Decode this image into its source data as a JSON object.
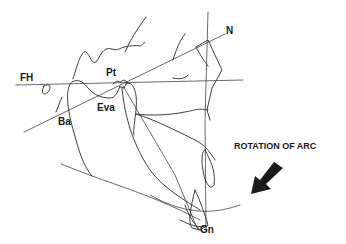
{
  "diagram": {
    "type": "cephalometric tracing",
    "labels": {
      "fh": "FH",
      "n": "N",
      "pt": "Pt",
      "ba": "Ba",
      "eva": "Eva",
      "gn": "Gn",
      "rotation": "ROTATION  OF ARC"
    },
    "arrow": {
      "direction": "down-left",
      "color": "#1a1a1a"
    },
    "line_color": "#2a2a2a"
  }
}
